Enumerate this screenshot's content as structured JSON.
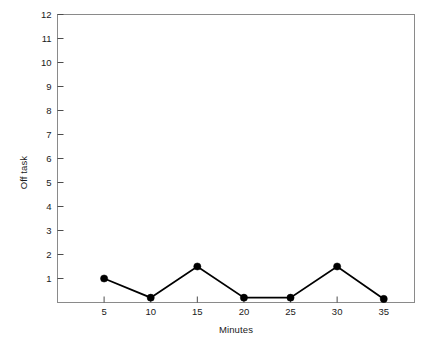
{
  "chart_data": {
    "type": "line",
    "title": "",
    "xlabel": "Minutes",
    "ylabel": "Off task",
    "x": [
      5,
      10,
      15,
      20,
      25,
      30,
      35
    ],
    "values": [
      1,
      0.2,
      1.5,
      0.2,
      0.2,
      1.5,
      0.15
    ],
    "series": [
      {
        "name": "Off task",
        "values": [
          1,
          0.2,
          1.5,
          0.2,
          0.2,
          1.5,
          0.15
        ]
      }
    ],
    "xlim": [
      0,
      38.3
    ],
    "ylim": [
      0,
      12
    ],
    "xticks": [
      5,
      10,
      15,
      20,
      25,
      30,
      35
    ],
    "xtick_labels": [
      "5",
      "10",
      "15",
      "20",
      "25",
      "30",
      "35"
    ],
    "yticks": [
      1,
      2,
      3,
      4,
      5,
      6,
      7,
      8,
      9,
      10,
      11,
      12
    ],
    "ytick_labels": [
      "1",
      "2",
      "3",
      "4",
      "5",
      "6",
      "7",
      "8",
      "9",
      "10",
      "11",
      "12"
    ],
    "grid": false,
    "legend": false,
    "legend_position": "none",
    "marker": "filled-circle",
    "line_color": "#000000",
    "marker_color": "#000000",
    "frame_color": "#808080",
    "background_color": "#ffffff"
  }
}
